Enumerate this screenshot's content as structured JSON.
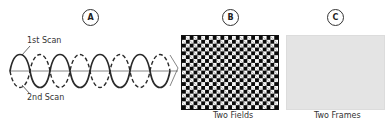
{
  "panels": [
    {
      "id": "A",
      "label": "A",
      "captions": {
        "top": "1st Scan",
        "bottom": "2nd Scan"
      }
    },
    {
      "id": "B",
      "label": "B",
      "caption": "Two Fields"
    },
    {
      "id": "C",
      "label": "C",
      "caption": "Two Frames"
    }
  ],
  "colors": {
    "line": "#2a2a2a",
    "checker_dark": "#0a0a0a",
    "checker_light": "#fafafa",
    "frame_gray": "#e4e4e4"
  }
}
